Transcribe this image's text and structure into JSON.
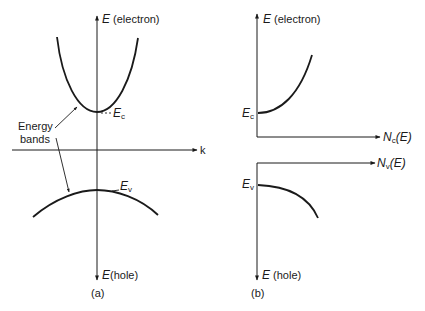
{
  "figure": {
    "panel_a": {
      "caption": "(a)",
      "y_axis_top_label_sym": "E",
      "y_axis_top_label_text": " (electron)",
      "y_axis_bottom_label_sym": "E",
      "y_axis_bottom_label_text": "(hole)",
      "x_axis_label": "k",
      "conduction_edge_sym": "E",
      "conduction_edge_sub": "c",
      "valence_edge_sym": "E",
      "valence_edge_sub": "v",
      "annotation_line1": "Energy",
      "annotation_line2": "bands"
    },
    "panel_b": {
      "caption": "(b)",
      "y_axis_top_label_sym": "E",
      "y_axis_top_label_text": " (electron)",
      "y_axis_bottom_label_sym": "E",
      "y_axis_bottom_label_text": " (hole)",
      "nc_axis_sym": "N",
      "nc_axis_sub": "c",
      "nc_axis_arg": "(E)",
      "nv_axis_sym": "N",
      "nv_axis_sub": "v",
      "nv_axis_arg": "(E)",
      "conduction_edge_sym": "E",
      "conduction_edge_sub": "c",
      "valence_edge_sym": "E",
      "valence_edge_sub": "v"
    }
  }
}
